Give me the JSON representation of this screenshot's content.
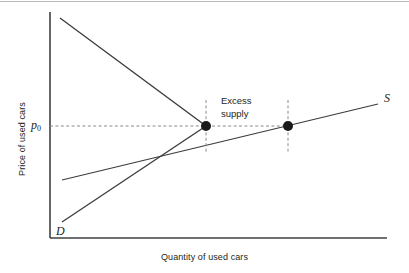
{
  "figure": {
    "background_color": "#ffffff",
    "top_rule_color": "#b9b9b9",
    "line_color": "#3b3b3b",
    "axis_color": "#404040",
    "marker_color": "#1a1a1a",
    "dash_color": "#8a8a8a"
  },
  "axes": {
    "x_title": "Quantity of used cars",
    "y_title": "Price of used cars",
    "x_axis": {
      "x1": 50,
      "y1": 238,
      "x2": 387,
      "y2": 238
    },
    "y_axis": {
      "x1": 50,
      "y1": 12,
      "x2": 50,
      "y2": 238
    }
  },
  "labels": {
    "supply_curve": "S",
    "demand_curve": "D",
    "price_symbol": "p",
    "price_subscript": "0",
    "annotation_line1": "Excess",
    "annotation_line2": "supply"
  },
  "chart_data": {
    "type": "line",
    "title": "",
    "xlabel": "Quantity of used cars",
    "ylabel": "Price of used cars",
    "grid": false,
    "legend": "inline curve labels at line ends",
    "axis_note": "Unlabeled qualitative axes; only the price level p0 is marked.",
    "series": [
      {
        "name": "D",
        "label": "D",
        "description": "Demand relation, drawn as a kinked path: steeply falling from high price at low quantity down to the equilibrium point, then continuing as a steeply rising segment toward the lower left (adverse-selection style demand).",
        "points": [
          {
            "x": 60,
            "y": 18
          },
          {
            "x": 206,
            "y": 126
          },
          {
            "x": 62,
            "y": 222
          }
        ],
        "color": "#3b3b3b"
      },
      {
        "name": "S",
        "label": "S",
        "description": "Supply curve, gently upward sloping from lower left to upper right.",
        "points": [
          {
            "x": 62,
            "y": 180
          },
          {
            "x": 378,
            "y": 104
          }
        ],
        "color": "#3b3b3b"
      }
    ],
    "markers": [
      {
        "name": "demand-quantity-point",
        "x": 206,
        "y": 126,
        "label": "Quantity demanded at p0",
        "radius": 5
      },
      {
        "name": "supply-quantity-point",
        "x": 288,
        "y": 126,
        "label": "Quantity supplied at p0",
        "radius": 5
      }
    ],
    "reference_lines": [
      {
        "name": "price-level-line",
        "orientation": "horizontal",
        "value_label": "p0",
        "x1": 50,
        "y1": 126,
        "x2": 288,
        "y2": 126,
        "style": "dashed"
      },
      {
        "name": "demand-quantity-dropline",
        "orientation": "vertical",
        "x1": 206,
        "y1": 100,
        "x2": 206,
        "y2": 152,
        "style": "dashed"
      },
      {
        "name": "supply-quantity-dropline",
        "orientation": "vertical",
        "x1": 288,
        "y1": 100,
        "x2": 288,
        "y2": 152,
        "style": "dashed"
      }
    ],
    "annotations": [
      {
        "name": "excess-supply",
        "text": "Excess supply",
        "x": 221,
        "y": 94,
        "description": "Labels the horizontal gap between quantity demanded and quantity supplied at price p0."
      }
    ],
    "intersection_note": {
      "description": "The rising demand segment crosses the supply curve at the market equilibrium below p0.",
      "x": 152,
      "y": 157
    }
  }
}
